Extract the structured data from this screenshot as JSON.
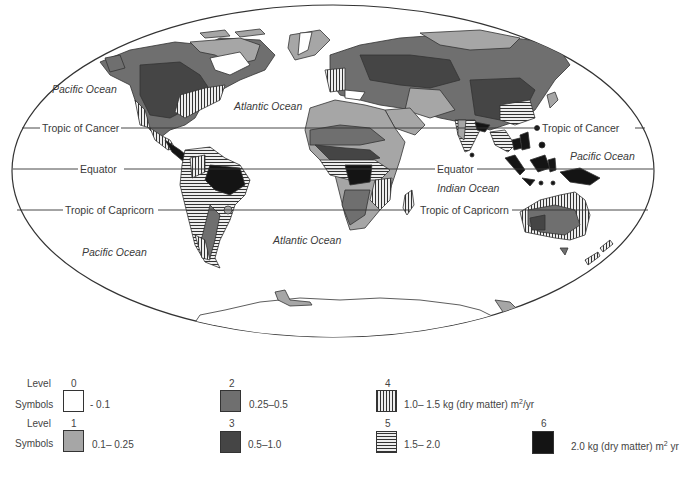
{
  "map": {
    "latitude_lines": {
      "tropic_of_cancer": "Tropic of Cancer",
      "equator": "Equator",
      "tropic_of_capricorn": "Tropic of Capricorn"
    },
    "oceans": {
      "pacific_nw": "Pacific Ocean",
      "atlantic_n": "Atlantic Ocean",
      "pacific_e": "Pacific Ocean",
      "indian": "Indian Ocean",
      "pacific_sw": "Pacific Ocean",
      "atlantic_s": "Atlantic Ocean"
    }
  },
  "legend": {
    "level_label": "Level",
    "symbols_label": "Symbols",
    "items": [
      {
        "level": "0",
        "range": "- 0.1",
        "color": "#ffffff",
        "pattern": "blank"
      },
      {
        "level": "1",
        "range": "0.1– 0.25",
        "color": "#a6a6a6",
        "pattern": "light-gray"
      },
      {
        "level": "2",
        "range": "0.25–0.5",
        "color": "#6f6f6f",
        "pattern": "medium-gray"
      },
      {
        "level": "3",
        "range": "0.5–1.0",
        "color": "#454545",
        "pattern": "dark-gray"
      },
      {
        "level": "4",
        "range": "1.0– 1.5 kg (dry matter) m",
        "unit_sup": "2",
        "unit_tail": "/yr",
        "color": "#333333",
        "pattern": "vertical-lines"
      },
      {
        "level": "5",
        "range": "1.5– 2.0",
        "color": "#333333",
        "pattern": "horizontal-lines"
      },
      {
        "level": "6",
        "range": "2.0 kg (dry matter) m",
        "unit_sup": "2",
        "unit_tail": " yr",
        "color": "#141414",
        "pattern": "black"
      }
    ]
  }
}
